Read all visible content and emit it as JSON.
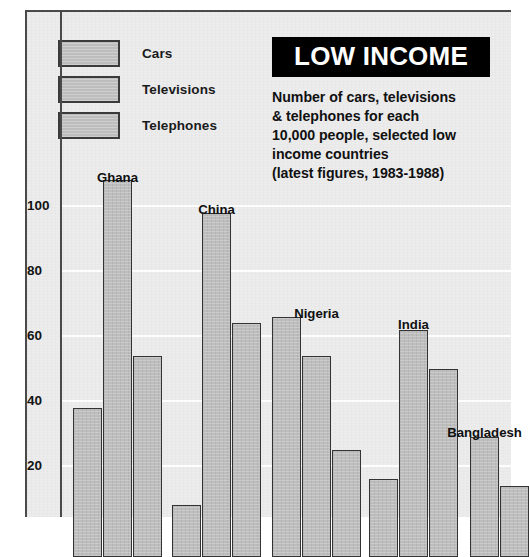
{
  "title": "LOW INCOME",
  "subtitle_lines": [
    "Number of cars, televisions",
    "& telephones for each",
    "10,000 people, selected low",
    "income countries",
    "(latest figures, 1983-1988)"
  ],
  "legend": [
    {
      "label": "Cars",
      "color": "#bdbdbd"
    },
    {
      "label": "Televisions",
      "color": "#bdbdbd"
    },
    {
      "label": "Telephones",
      "color": "#bdbdbd"
    }
  ],
  "colors": {
    "bar_fill": "#bdbdbd",
    "bar_border": "#333333",
    "background": "#ececed",
    "banner_bg": "#000000",
    "banner_text": "#ffffff",
    "gridline": "#fdfdfd",
    "axis": "#4a4a4a",
    "text": "#111111"
  },
  "chart_data": {
    "type": "bar",
    "title": "LOW INCOME",
    "subtitle": "Number of cars, televisions & telephones for each 10,000 people, selected low income countries (latest figures, 1983-1988)",
    "xlabel": "",
    "ylabel": "",
    "categories": [
      "Ghana",
      "China",
      "Nigeria",
      "India",
      "Bangladesh"
    ],
    "series": [
      {
        "name": "Cars",
        "values": [
          38,
          8,
          66,
          16,
          0
        ]
      },
      {
        "name": "Televisions",
        "values": [
          108,
          98,
          54,
          62,
          29
        ]
      },
      {
        "name": "Telephones",
        "values": [
          54,
          64,
          25,
          50,
          14
        ]
      }
    ],
    "ytick_labels": [
      "100",
      "80",
      "60",
      "40",
      "20"
    ],
    "ytick_values": [
      100,
      80,
      60,
      40,
      20
    ],
    "ylim": [
      0,
      115
    ],
    "grid": true,
    "grid_orientation": "horizontal",
    "legend_position": "top-left",
    "note": "baseline and x-axis are cropped below the bottom edge of the image"
  }
}
